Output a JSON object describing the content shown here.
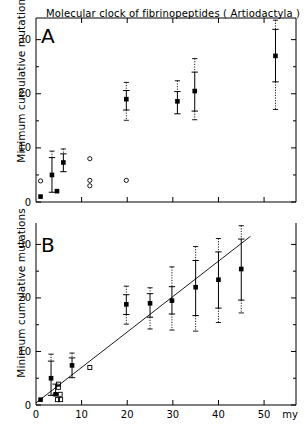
{
  "figure": {
    "title": "Molecular clock of fibrinopeptides ( Artiodactyla )",
    "axis_unit_label": "my",
    "panels": [
      {
        "letter": "A",
        "ylabel": "Minimum cumulative mutations"
      },
      {
        "letter": "B",
        "ylabel": "Minimum cumulative mutations"
      }
    ]
  },
  "chart_data": [
    {
      "type": "scatter",
      "panel": "A",
      "title": "Molecular clock of fibrinopeptides ( Artiodactyla )",
      "xlabel": "",
      "ylabel": "Minimum cumulative mutations",
      "xlim": [
        0,
        57
      ],
      "ylim": [
        0,
        34
      ],
      "xticks": [
        0,
        10,
        20,
        30,
        40,
        50
      ],
      "xticklabels": [
        "",
        "",
        "",
        "",
        "",
        ""
      ],
      "yticks": [
        0,
        10,
        20,
        30
      ],
      "yticklabels": [
        "0",
        "10",
        "20",
        "30"
      ],
      "yminorticks": [
        5,
        15,
        25
      ],
      "grid": false,
      "legend": false,
      "series": [
        {
          "name": "filled squares with error bars",
          "marker": "filled-square",
          "points": [
            {
              "x": 1.0,
              "y": 1.0,
              "err_low": 1.0,
              "err_high": 1.0,
              "dash_low": 1.0,
              "dash_high": 1.0
            },
            {
              "x": 3.5,
              "y": 5.0,
              "err_low": 1.8,
              "err_high": 8.2,
              "dash_low": 1.8,
              "dash_high": 9.4
            },
            {
              "x": 4.6,
              "y": 2.0,
              "err_low": 2.0,
              "err_high": 2.0,
              "dash_low": 2.0,
              "dash_high": 2.0
            },
            {
              "x": 6.0,
              "y": 7.3,
              "err_low": 5.6,
              "err_high": 8.9,
              "dash_low": 5.6,
              "dash_high": 9.8
            },
            {
              "x": 19.8,
              "y": 19.0,
              "err_low": 17.0,
              "err_high": 20.6,
              "dash_low": 15.1,
              "dash_high": 22.1
            },
            {
              "x": 31.0,
              "y": 18.6,
              "err_low": 16.3,
              "err_high": 20.4,
              "dash_low": 16.3,
              "dash_high": 22.4
            },
            {
              "x": 34.8,
              "y": 20.5,
              "err_low": 16.8,
              "err_high": 24.0,
              "dash_low": 15.2,
              "dash_high": 26.5
            },
            {
              "x": 52.5,
              "y": 27.0,
              "err_low": 22.2,
              "err_high": 31.9,
              "dash_low": 17.1,
              "dash_high": 33.6
            }
          ]
        },
        {
          "name": "open circles",
          "marker": "open-circle",
          "points": [
            {
              "x": 1.0,
              "y": 3.9
            },
            {
              "x": 11.8,
              "y": 8.0
            },
            {
              "x": 11.8,
              "y": 4.0
            },
            {
              "x": 11.8,
              "y": 3.0
            },
            {
              "x": 19.8,
              "y": 4.0
            }
          ]
        }
      ]
    },
    {
      "type": "scatter",
      "panel": "B",
      "title": "",
      "xlabel": "my",
      "ylabel": "Minimum cumulative mutations",
      "xlim": [
        0,
        57
      ],
      "ylim": [
        0,
        34
      ],
      "xticks": [
        0,
        10,
        20,
        30,
        40,
        50
      ],
      "xticklabels": [
        "0",
        "10",
        "20",
        "30",
        "40",
        "50"
      ],
      "yticks": [
        0,
        10,
        20,
        30
      ],
      "yticklabels": [
        "0",
        "10",
        "20",
        "30"
      ],
      "yminorticks": [
        5,
        15,
        25
      ],
      "grid": false,
      "legend": false,
      "regression_line": {
        "x_start": 0.0,
        "y_start": 0.4,
        "x_end": 47.0,
        "y_end": 31.5
      },
      "series": [
        {
          "name": "filled squares with error bars",
          "marker": "filled-square",
          "points": [
            {
              "x": 1.0,
              "y": 1.0,
              "err_low": 1.0,
              "err_high": 1.0,
              "dash_low": 1.0,
              "dash_high": 1.0
            },
            {
              "x": 3.3,
              "y": 5.0,
              "err_low": 1.8,
              "err_high": 8.2,
              "dash_low": 1.8,
              "dash_high": 9.5
            },
            {
              "x": 4.3,
              "y": 2.0,
              "err_low": 2.0,
              "err_high": 3.9,
              "dash_low": 2.0,
              "dash_high": 3.9
            },
            {
              "x": 7.9,
              "y": 7.4,
              "err_low": 5.1,
              "err_high": 8.8,
              "dash_low": 5.1,
              "dash_high": 9.7
            },
            {
              "x": 19.8,
              "y": 18.8,
              "err_low": 16.9,
              "err_high": 20.6,
              "dash_low": 15.1,
              "dash_high": 22.2
            },
            {
              "x": 25.0,
              "y": 19.0,
              "err_low": 16.4,
              "err_high": 20.8,
              "dash_low": 14.2,
              "dash_high": 21.9
            },
            {
              "x": 29.8,
              "y": 19.5,
              "err_low": 17.0,
              "err_high": 22.1,
              "dash_low": 14.0,
              "dash_high": 25.8
            },
            {
              "x": 35.0,
              "y": 22.0,
              "err_low": 16.7,
              "err_high": 27.0,
              "dash_low": 13.8,
              "dash_high": 29.6
            },
            {
              "x": 40.0,
              "y": 23.4,
              "err_low": 18.1,
              "err_high": 28.6,
              "dash_low": 15.4,
              "dash_high": 31.1
            },
            {
              "x": 45.0,
              "y": 25.4,
              "err_low": 19.6,
              "err_high": 31.0,
              "dash_low": 17.2,
              "dash_high": 33.5
            }
          ]
        },
        {
          "name": "open squares",
          "marker": "open-square",
          "points": [
            {
              "x": 4.9,
              "y": 3.9
            },
            {
              "x": 4.9,
              "y": 3.3
            },
            {
              "x": 5.3,
              "y": 2.0
            },
            {
              "x": 4.7,
              "y": 1.0
            },
            {
              "x": 5.4,
              "y": 1.0
            },
            {
              "x": 11.8,
              "y": 7.0
            }
          ]
        }
      ]
    }
  ]
}
